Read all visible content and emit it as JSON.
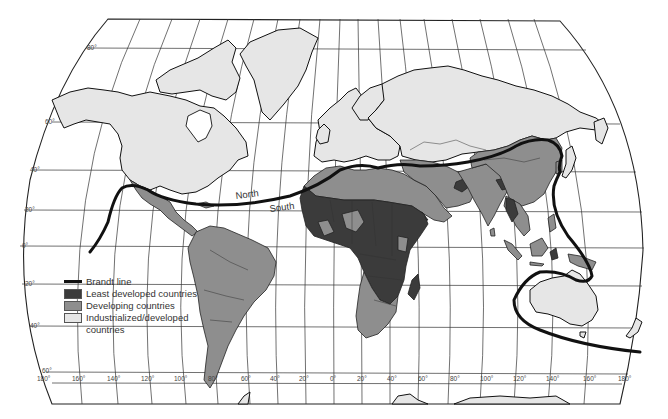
{
  "map": {
    "title": "Brandt line world map",
    "labels": {
      "north": "North",
      "south": "South"
    },
    "colors": {
      "industrialized": "#e6e6e6",
      "developing": "#8e8e8e",
      "least_developed": "#3b3b3b",
      "brandt_line": "#111111"
    },
    "latitude_labels": [
      "80°",
      "60°",
      "40°",
      "20°",
      "0°",
      "20°",
      "40°",
      "60°"
    ],
    "longitude_labels": [
      "180°",
      "160°",
      "140°",
      "120°",
      "100°",
      "80°",
      "60°",
      "40°",
      "20°",
      "0°",
      "20°",
      "40°",
      "60°",
      "80°",
      "100°",
      "120°",
      "140°",
      "160°",
      "180°"
    ]
  },
  "legend": {
    "items": [
      {
        "label": "Brandt line",
        "type": "line"
      },
      {
        "label": "Least developed countries",
        "type": "least_developed"
      },
      {
        "label": "Developing countries",
        "type": "developing"
      },
      {
        "label": "Industrialized/developed",
        "type": "industrialized"
      }
    ],
    "continuation": "countries"
  }
}
